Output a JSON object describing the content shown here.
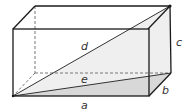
{
  "diagram": {
    "type": "rectangular-prism",
    "labels": {
      "a": "a",
      "b": "b",
      "c": "c",
      "d": "d",
      "e": "e"
    },
    "colors": {
      "edge": "#1a1a1a",
      "hidden_edge": "#777777",
      "face_fill": "#f4f4f4",
      "triangle_fill": "#ececec",
      "base_triangle_fill": "#d6d6d6",
      "label": "#333333"
    }
  }
}
